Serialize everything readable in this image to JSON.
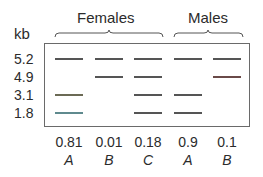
{
  "figure": {
    "unit_label": "kb",
    "groups": [
      {
        "label": "Females",
        "lanes": [
          0,
          1,
          2
        ]
      },
      {
        "label": "Males",
        "lanes": [
          3,
          4
        ]
      }
    ],
    "sizes": [
      "5.2",
      "4.9",
      "3.1",
      "1.8"
    ],
    "lanes": [
      {
        "frequency": "0.81",
        "genotype": "A",
        "bands": [
          "5.2",
          "3.1",
          "1.8"
        ]
      },
      {
        "frequency": "0.01",
        "genotype": "B",
        "bands": [
          "5.2",
          "4.9"
        ]
      },
      {
        "frequency": "0.18",
        "genotype": "C",
        "bands": [
          "5.2",
          "4.9",
          "3.1",
          "1.8"
        ]
      },
      {
        "frequency": "0.9",
        "genotype": "A",
        "bands": [
          "5.2",
          "3.1",
          "1.8"
        ]
      },
      {
        "frequency": "0.1",
        "genotype": "B",
        "bands": [
          "5.2",
          "4.9"
        ]
      }
    ],
    "colors": {
      "band": "#555555",
      "border": "#6a6a6a",
      "text": "#2b2b2b"
    }
  }
}
